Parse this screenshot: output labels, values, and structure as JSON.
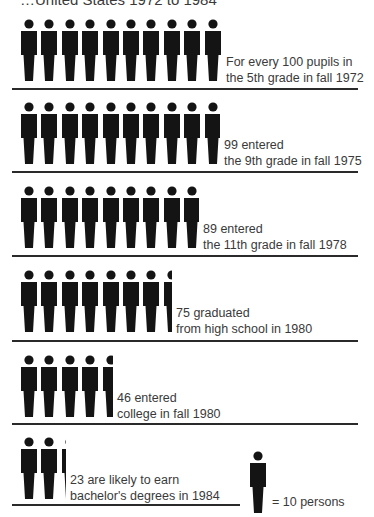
{
  "title": "…United States 1972 to 1984",
  "title_legible": false,
  "title_note": "Header is cropped to the bottom sliver of its glyphs; only the tail '…United States 1972 to 1984' can be made out. Leading word(s) are illegible and not transcribed.",
  "legend": {
    "icon": "person-icon",
    "label": "= 10 persons",
    "persons_per_icon": 10
  },
  "rows": [
    {
      "count": 100,
      "line1": "For every 100 pupils in",
      "line2": "the 5th grade in fall 1972"
    },
    {
      "count": 99,
      "line1": "99 entered",
      "line2": "the 9th grade in fall 1975"
    },
    {
      "count": 89,
      "line1": "89 entered",
      "line2": "the 11th grade in fall 1978"
    },
    {
      "count": 75,
      "line1": "75 graduated",
      "line2": "from high school in 1980"
    },
    {
      "count": 46,
      "line1": "46 entered",
      "line2": "college in fall 1980"
    },
    {
      "count": 23,
      "line1": "23 are likely to earn",
      "line2": "bachelor's degrees in 1984"
    }
  ],
  "colors": {
    "ink": "#141414",
    "text": "#3a3a3a",
    "rule": "#2a2a2a",
    "background": "#ffffff"
  },
  "chart_data": {
    "type": "bar",
    "subtype": "pictograph",
    "title": "…United States 1972 to 1984",
    "title_legible": false,
    "unit": "persons per 100 fifth-graders",
    "icon_value": 10,
    "categories": [
      "5th grade, fall 1972",
      "9th grade, fall 1975",
      "11th grade, fall 1978",
      "Graduated high school, 1980",
      "Entered college, fall 1980",
      "Bachelor's degrees, 1984"
    ],
    "values": [
      100,
      99,
      89,
      75,
      46,
      23
    ],
    "icons_shown": [
      10,
      9.9,
      8.9,
      7.5,
      4.6,
      2.3
    ],
    "legend": "= 10 persons",
    "orientation": "horizontal",
    "xlabel": "",
    "ylabel": ""
  }
}
